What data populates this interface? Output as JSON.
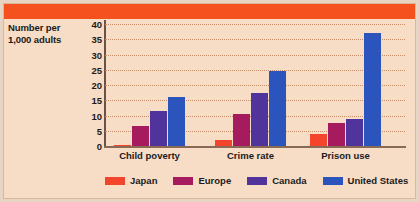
{
  "figure": {
    "banner_color": "#f4511e",
    "background_color": "#f7dcc6",
    "frame_color": "#d9b89c"
  },
  "axis": {
    "y_title_line1": "Number per",
    "y_title_line2": "1,000 adults"
  },
  "legend": {
    "items": [
      {
        "label": "Japan",
        "color": "#f4442b"
      },
      {
        "label": "Europe",
        "color": "#a51b5e"
      },
      {
        "label": "Canada",
        "color": "#51339c"
      },
      {
        "label": "United States",
        "color": "#2b54bc"
      }
    ]
  },
  "chart_data": {
    "type": "bar",
    "title": "",
    "xlabel": "",
    "ylabel": "Number per 1,000 adults",
    "ylim": [
      0,
      40
    ],
    "ytick_step": 5,
    "yticks": [
      0,
      5,
      10,
      15,
      20,
      25,
      30,
      35,
      40
    ],
    "grid": true,
    "grid_style": "dotted-horizontal",
    "legend_position": "bottom",
    "categories": [
      "Child poverty",
      "Crime rate",
      "Prison use"
    ],
    "series": [
      {
        "name": "Japan",
        "color": "#f4442b",
        "values": [
          0.3,
          2.0,
          4.0
        ]
      },
      {
        "name": "Europe",
        "color": "#a51b5e",
        "values": [
          6.5,
          10.5,
          7.5
        ]
      },
      {
        "name": "Canada",
        "color": "#51339c",
        "values": [
          11.5,
          17.5,
          9.0
        ]
      },
      {
        "name": "United States",
        "color": "#2b54bc",
        "values": [
          16.0,
          24.5,
          37.0
        ]
      }
    ]
  }
}
